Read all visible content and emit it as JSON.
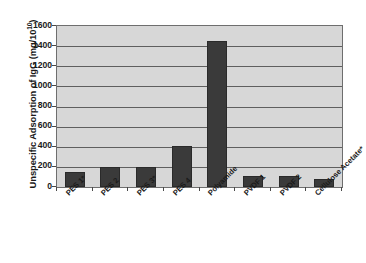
{
  "chart_data": {
    "type": "bar",
    "title": "",
    "xlabel": "",
    "ylabel": "Unspecific Adsorption of IgG (mg/10¹⁰)",
    "ylabel_base": "Unspecific Adsorption of IgG (mg/10",
    "ylabel_exponent": "10",
    "ylabel_suffix": ")",
    "categories": [
      "PES 1*",
      "PES 2",
      "PES 3*",
      "PES 4",
      "Polyamide",
      "PVDF 1",
      "PVDF 2",
      "Cellulose Acetate*"
    ],
    "values": [
      145,
      195,
      195,
      410,
      1455,
      105,
      105,
      75
    ],
    "ylim": [
      0,
      1600
    ],
    "ytick_step": 200,
    "yticks": [
      1600,
      1400,
      1200,
      1000,
      800,
      600,
      400,
      200,
      0
    ],
    "ytick_labels": [
      "1600",
      "1400",
      "1200",
      "1000",
      "800",
      "600",
      "400",
      "200",
      "0"
    ],
    "grid": true,
    "grid_axis": "y",
    "legend": false,
    "legend_position": "none",
    "series": [
      {
        "name": "Unspecific Adsorption of IgG",
        "values": [
          145,
          195,
          195,
          410,
          1455,
          105,
          105,
          75
        ]
      }
    ],
    "colors": {
      "bar": "#3a3a3a",
      "bar_border": "#2a2a2a",
      "plot_background": "#d7d7d7",
      "plot_border": "#6e6e6e",
      "gridline": "#5f5f5f",
      "text": "#1a1a1a",
      "figure_background": "#ffffff"
    }
  }
}
